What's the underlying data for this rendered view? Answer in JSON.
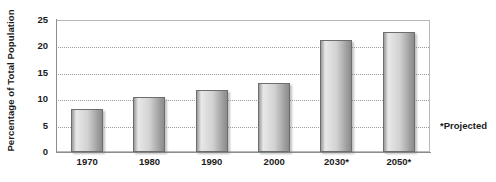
{
  "chart_data": {
    "type": "bar",
    "title": "",
    "xlabel": "",
    "ylabel": "Percentage of Total Population",
    "categories": [
      "1970",
      "1980",
      "1990",
      "2000",
      "2030*",
      "2050*"
    ],
    "values": [
      8.1,
      10.4,
      11.7,
      13.0,
      21.2,
      22.7
    ],
    "ylim": [
      0,
      25
    ],
    "yticks": [
      0,
      5,
      10,
      15,
      20,
      25
    ],
    "ytick_labels": [
      "0",
      "5",
      "10",
      "15",
      "20",
      "25"
    ],
    "grid": true,
    "grid_axis": "y",
    "legend": "none",
    "annotations": [
      {
        "name": "projected-note",
        "text": "*Projected"
      }
    ],
    "series": [
      {
        "name": "Percentage of Total Population",
        "values": [
          8.1,
          10.4,
          11.7,
          13.0,
          21.2,
          22.7
        ]
      }
    ],
    "colors": {
      "bar_light": "#e8e8e8",
      "bar_mid": "#d2d2d2",
      "bar_dark": "#8c8c8c",
      "bar_border": "#6d6d6d",
      "gridline": "#9a9a9a",
      "axis": "#8d8d8d",
      "text": "#1b1b1b",
      "background": "#ffffff"
    }
  },
  "footnote": {
    "text": "*Projected"
  }
}
